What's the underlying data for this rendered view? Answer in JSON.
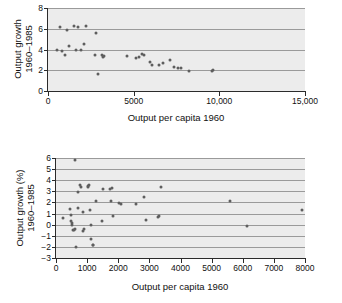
{
  "figure": {
    "background": "#ffffff",
    "plot_background": "#ececec",
    "point_color": "#5e5e5e",
    "gridline_color": "#9a9a9a",
    "axis_color": "#2b2b2b"
  },
  "chart_data": [
    {
      "id": "top",
      "type": "scatter",
      "title": "",
      "xlabel": "Output per capita 1960",
      "ylabel_line1": "Output growth",
      "ylabel_line2": "1960–1985",
      "xlim": [
        0,
        15000
      ],
      "ylim": [
        0,
        8
      ],
      "xticks": [
        0,
        5000,
        10000,
        15000
      ],
      "xticklabels": [
        "0",
        "5000",
        "10,000",
        "15,000"
      ],
      "yticks": [
        0,
        2,
        4,
        6,
        8
      ],
      "yticklabels": [
        "0",
        "2",
        "4",
        "6",
        "8"
      ],
      "grid": "horizontal",
      "points": [
        [
          520,
          4.0
        ],
        [
          700,
          6.2
        ],
        [
          820,
          3.9
        ],
        [
          980,
          3.5
        ],
        [
          1080,
          5.9
        ],
        [
          1250,
          4.3
        ],
        [
          1500,
          6.3
        ],
        [
          1620,
          4.0
        ],
        [
          1780,
          6.2
        ],
        [
          1900,
          3.95
        ],
        [
          2100,
          4.55
        ],
        [
          2200,
          6.25
        ],
        [
          2750,
          3.45
        ],
        [
          2830,
          5.6
        ],
        [
          2900,
          1.6
        ],
        [
          3150,
          3.45
        ],
        [
          3200,
          3.3
        ],
        [
          3250,
          3.4
        ],
        [
          4600,
          3.4
        ],
        [
          5150,
          3.2
        ],
        [
          5300,
          3.25
        ],
        [
          5500,
          3.55
        ],
        [
          5600,
          3.45
        ],
        [
          5950,
          2.8
        ],
        [
          6050,
          2.5
        ],
        [
          6500,
          2.55
        ],
        [
          6700,
          2.7
        ],
        [
          7100,
          3.0
        ],
        [
          7350,
          2.3
        ],
        [
          7600,
          2.2
        ],
        [
          7750,
          2.2
        ],
        [
          8250,
          1.95
        ],
        [
          9550,
          1.9
        ],
        [
          9650,
          2.0
        ]
      ]
    },
    {
      "id": "bottom",
      "type": "scatter",
      "title": "",
      "xlabel": "Output per capita 1960",
      "ylabel_line1": "Output growth (%)",
      "ylabel_line2": "1960–1985",
      "xlim": [
        0,
        8000
      ],
      "ylim": [
        -3,
        6
      ],
      "xticks": [
        0,
        1000,
        2000,
        3000,
        4000,
        5000,
        6000,
        7000,
        8000
      ],
      "xticklabels": [
        "0",
        "1000",
        "2000",
        "3000",
        "4000",
        "5000",
        "6000",
        "7000",
        "8000"
      ],
      "yticks": [
        -3,
        -2,
        -1,
        0,
        1,
        2,
        3,
        4,
        5,
        6
      ],
      "yticklabels": [
        "−3",
        "−2",
        "−1",
        "0",
        "1",
        "2",
        "3",
        "4",
        "5",
        "6"
      ],
      "grid": "horizontal",
      "points": [
        [
          220,
          0.6
        ],
        [
          440,
          1.45
        ],
        [
          470,
          0.9
        ],
        [
          490,
          0.35
        ],
        [
          510,
          0.15
        ],
        [
          520,
          0.0
        ],
        [
          560,
          -0.45
        ],
        [
          580,
          -0.5
        ],
        [
          600,
          5.8
        ],
        [
          620,
          -0.35
        ],
        [
          640,
          -2.0
        ],
        [
          700,
          2.9
        ],
        [
          720,
          1.5
        ],
        [
          760,
          3.55
        ],
        [
          790,
          3.4
        ],
        [
          860,
          -0.55
        ],
        [
          880,
          1.1
        ],
        [
          900,
          -0.4
        ],
        [
          1020,
          3.5
        ],
        [
          1040,
          3.35
        ],
        [
          1060,
          3.6
        ],
        [
          1100,
          1.3
        ],
        [
          1120,
          -0.05
        ],
        [
          1140,
          -1.3
        ],
        [
          1180,
          -1.8
        ],
        [
          1200,
          -1.85
        ],
        [
          1270,
          2.1
        ],
        [
          1480,
          0.35
        ],
        [
          1520,
          3.2
        ],
        [
          1740,
          3.25
        ],
        [
          1760,
          2.15
        ],
        [
          1790,
          3.3
        ],
        [
          1820,
          0.8
        ],
        [
          2040,
          1.95
        ],
        [
          2100,
          1.9
        ],
        [
          2560,
          1.85
        ],
        [
          2830,
          2.5
        ],
        [
          2880,
          0.45
        ],
        [
          3280,
          0.7
        ],
        [
          3320,
          0.75
        ],
        [
          3380,
          3.4
        ],
        [
          5600,
          2.1
        ],
        [
          6150,
          -0.1
        ],
        [
          7900,
          1.3
        ]
      ]
    }
  ]
}
